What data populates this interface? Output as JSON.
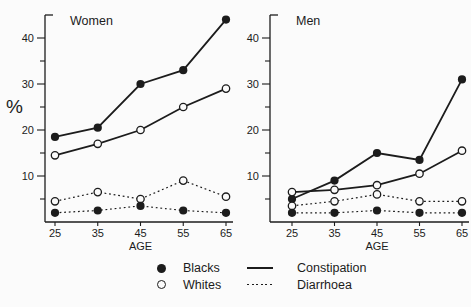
{
  "figure": {
    "ink_color": "#1c1c1c",
    "background": "#fbfbfb",
    "legend": {
      "markers": [
        {
          "name": "blacks",
          "label": "Blacks",
          "marker": "filled-circle"
        },
        {
          "name": "whites",
          "label": "Whites",
          "marker": "open-circle"
        }
      ],
      "lines": [
        {
          "name": "constipation",
          "label": "Constipation",
          "style": "solid"
        },
        {
          "name": "diarrhoea",
          "label": "Diarrhoea",
          "style": "dotted"
        }
      ]
    }
  },
  "chart_data": [
    {
      "type": "line",
      "title": "Women",
      "x": [
        25,
        35,
        45,
        55,
        65
      ],
      "xlabel": "AGE",
      "ylabel": "%",
      "ylim": [
        0,
        45
      ],
      "yticks": [
        10,
        20,
        30,
        40
      ],
      "y_minor_tick_step": 5,
      "grid": false,
      "series": [
        {
          "name": "Blacks Constipation",
          "group": "Blacks",
          "condition": "Constipation",
          "marker": "filled",
          "line": "solid",
          "values": [
            18.5,
            20.5,
            30,
            33,
            44
          ]
        },
        {
          "name": "Whites Constipation",
          "group": "Whites",
          "condition": "Constipation",
          "marker": "open",
          "line": "solid",
          "values": [
            14.5,
            17,
            20,
            25,
            29
          ]
        },
        {
          "name": "Whites Diarrhoea",
          "group": "Whites",
          "condition": "Diarrhoea",
          "marker": "open",
          "line": "dotted",
          "values": [
            4.5,
            6.5,
            5,
            9,
            5.5
          ]
        },
        {
          "name": "Blacks Diarrhoea",
          "group": "Blacks",
          "condition": "Diarrhoea",
          "marker": "filled",
          "line": "dotted",
          "values": [
            2,
            2.5,
            3.5,
            2.5,
            2
          ]
        }
      ]
    },
    {
      "type": "line",
      "title": "Men",
      "x": [
        25,
        35,
        45,
        55,
        65
      ],
      "xlabel": "AGE",
      "ylabel": "",
      "ylim": [
        0,
        45
      ],
      "yticks": [
        10,
        20,
        30,
        40
      ],
      "y_minor_tick_step": 5,
      "grid": false,
      "series": [
        {
          "name": "Blacks Constipation",
          "group": "Blacks",
          "condition": "Constipation",
          "marker": "filled",
          "line": "solid",
          "values": [
            5,
            9,
            15,
            13.5,
            31
          ]
        },
        {
          "name": "Whites Constipation",
          "group": "Whites",
          "condition": "Constipation",
          "marker": "open",
          "line": "solid",
          "values": [
            6.5,
            7,
            8,
            10.5,
            15.5
          ]
        },
        {
          "name": "Whites Diarrhoea",
          "group": "Whites",
          "condition": "Diarrhoea",
          "marker": "open",
          "line": "dotted",
          "values": [
            3.5,
            4.5,
            6,
            4.5,
            4.5
          ]
        },
        {
          "name": "Blacks Diarrhoea",
          "group": "Blacks",
          "condition": "Diarrhoea",
          "marker": "filled",
          "line": "dotted",
          "values": [
            2,
            2,
            2.5,
            2,
            2
          ]
        }
      ]
    }
  ]
}
